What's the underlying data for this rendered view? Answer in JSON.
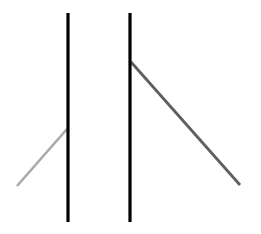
{
  "canvas": {
    "width": 261,
    "height": 234,
    "background": "#ffffff"
  },
  "lines": [
    {
      "id": "left-vertical",
      "x1": 68,
      "y1": 13,
      "x2": 68,
      "y2": 222,
      "color": "#000000",
      "width": 3.2
    },
    {
      "id": "right-vertical",
      "x1": 130,
      "y1": 13,
      "x2": 130,
      "y2": 222,
      "color": "#000000",
      "width": 3.2
    },
    {
      "id": "light-diagonal",
      "x1": 17,
      "y1": 186,
      "x2": 67,
      "y2": 129,
      "color": "#aaaaaa",
      "width": 2.6
    },
    {
      "id": "dark-diagonal",
      "x1": 131,
      "y1": 62,
      "x2": 240,
      "y2": 185,
      "color": "#5f5f5f",
      "width": 2.8
    }
  ]
}
